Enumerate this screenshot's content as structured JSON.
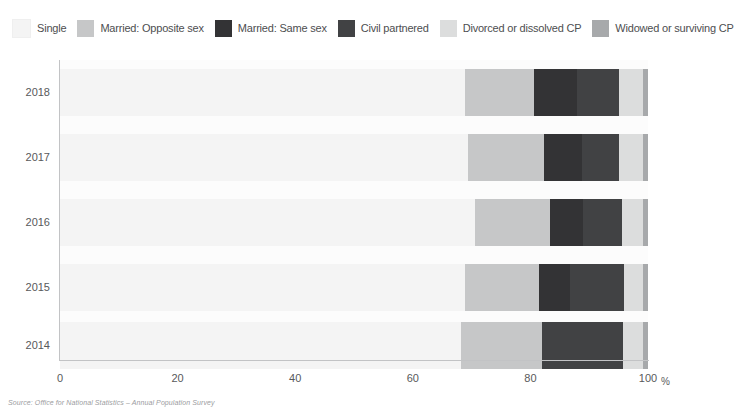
{
  "legend": {
    "items": [
      {
        "label": "Single",
        "color": "#f4f4f4"
      },
      {
        "label": "Married: Opposite sex",
        "color": "#c6c7c8"
      },
      {
        "label": "Married: Same sex",
        "color": "#333335"
      },
      {
        "label": "Civil partnered",
        "color": "#414244"
      },
      {
        "label": "Divorced or dissolved CP",
        "color": "#dcdddd"
      },
      {
        "label": "Widowed or surviving CP",
        "color": "#a7a9ab"
      }
    ]
  },
  "axis": {
    "x_ticks": [
      "0",
      "20",
      "40",
      "60",
      "80",
      "100"
    ],
    "x_unit": "%",
    "y_ticks": [
      "2018",
      "2017",
      "2016",
      "2015",
      "2014"
    ]
  },
  "source": "Source: Office for National Statistics – Annual Population Survey",
  "chart_data": {
    "type": "bar",
    "orientation": "horizontal",
    "stacked": true,
    "title": "",
    "xlabel": "%",
    "ylabel": "",
    "xlim": [
      0,
      100
    ],
    "grid": false,
    "legend_position": "top",
    "categories": [
      "2018",
      "2017",
      "2016",
      "2015",
      "2014"
    ],
    "series": [
      {
        "name": "Single",
        "color": "#f4f4f4",
        "values": [
          68.9,
          69.4,
          70.6,
          68.9,
          68.2
        ]
      },
      {
        "name": "Married: Opposite sex",
        "color": "#c6c7c8",
        "values": [
          11.7,
          12.9,
          12.8,
          12.6,
          13.8
        ]
      },
      {
        "name": "Married: Same sex",
        "color": "#333335",
        "values": [
          7.3,
          6.5,
          5.6,
          5.3,
          0.0
        ]
      },
      {
        "name": "Civil partnered",
        "color": "#414244",
        "values": [
          7.1,
          6.3,
          6.6,
          9.2,
          13.8
        ]
      },
      {
        "name": "Divorced or dissolved CP",
        "color": "#dcdddd",
        "values": [
          4.1,
          4.0,
          3.6,
          3.2,
          3.4
        ]
      },
      {
        "name": "Widowed or surviving CP",
        "color": "#a7a9ab",
        "values": [
          0.9,
          0.9,
          0.8,
          0.8,
          0.8
        ]
      }
    ]
  }
}
